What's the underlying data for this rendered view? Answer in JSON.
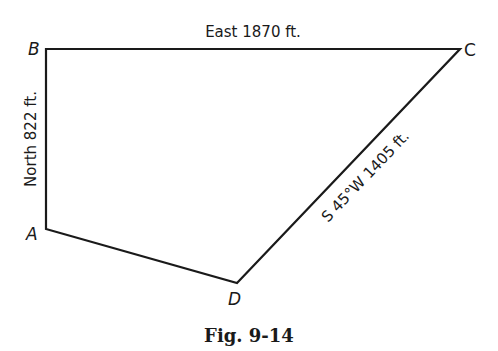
{
  "figure": {
    "caption": "Fig. 9-14",
    "vertices": {
      "A": {
        "label": "A",
        "x": 46,
        "y": 229
      },
      "B": {
        "label": "B",
        "x": 46,
        "y": 49
      },
      "C": {
        "label": "C",
        "x": 460,
        "y": 49
      },
      "D": {
        "label": "D",
        "x": 237,
        "y": 283
      }
    },
    "edges": {
      "AB": {
        "label": "North 822 ft."
      },
      "BC": {
        "label": "East 1870 ft."
      },
      "CD": {
        "label": "S 45°W 1405 ft."
      },
      "DA": {
        "label": ""
      }
    },
    "colors": {
      "line": "#1a1a1a",
      "background": "#ffffff"
    }
  }
}
